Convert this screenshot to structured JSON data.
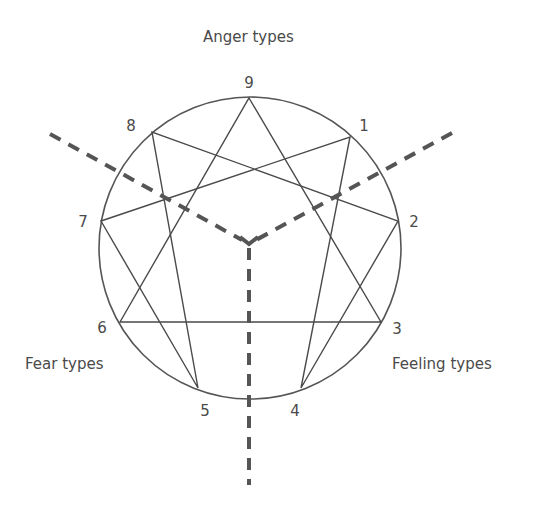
{
  "diagram": {
    "type": "enneagram",
    "groups": {
      "top": "Anger types",
      "left": "Fear types",
      "right": "Feeling types"
    },
    "points": [
      {
        "label": "9",
        "x": 249,
        "y": 98,
        "lx": 249,
        "ly": 83
      },
      {
        "label": "1",
        "x": 350,
        "y": 137,
        "lx": 364,
        "ly": 126
      },
      {
        "label": "2",
        "x": 398,
        "y": 221,
        "lx": 414,
        "ly": 222
      },
      {
        "label": "3",
        "x": 381,
        "y": 322,
        "lx": 397,
        "ly": 329
      },
      {
        "label": "4",
        "x": 301,
        "y": 388,
        "lx": 295,
        "ly": 411
      },
      {
        "label": "5",
        "x": 198,
        "y": 388,
        "lx": 205,
        "ly": 411
      },
      {
        "label": "6",
        "x": 120,
        "y": 322,
        "lx": 102,
        "ly": 328
      },
      {
        "label": "7",
        "x": 101,
        "y": 221,
        "lx": 83,
        "ly": 222
      },
      {
        "label": "8",
        "x": 152,
        "y": 132,
        "lx": 131,
        "ly": 126
      }
    ],
    "colors": {
      "line": "#4a4a4a",
      "dash": "#555555",
      "text": "#4a4a4a"
    }
  }
}
